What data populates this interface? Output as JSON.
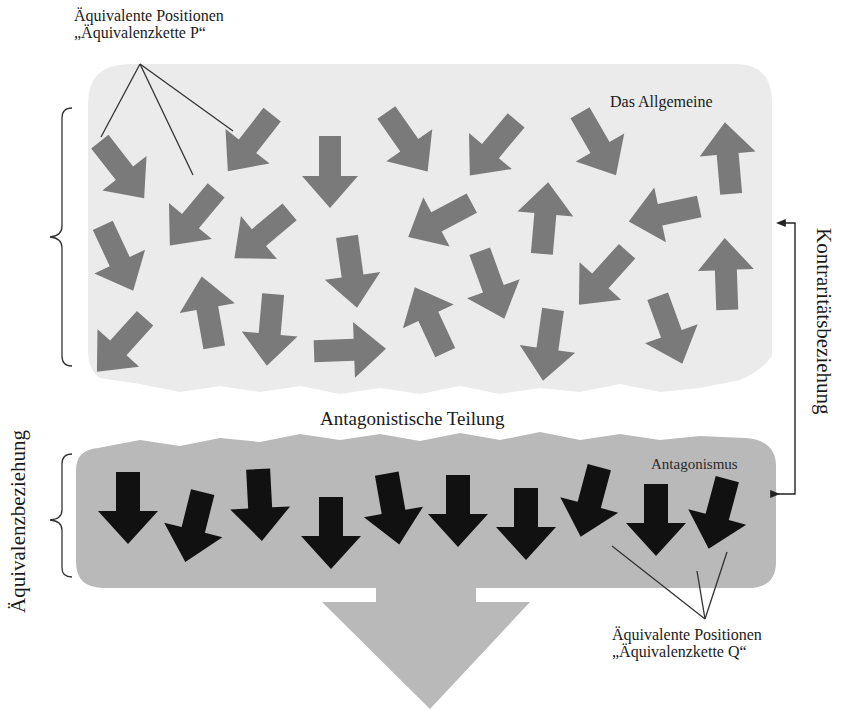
{
  "diagram": {
    "labels": {
      "equivalent_positions_top_line1": "Äquivalente Positionen",
      "equivalent_positions_top_line2": "„Äquivalenzkette P“",
      "general_region": "Das Allgemeine",
      "division": "Antagonistische Teilung",
      "antagonism_region": "Antagonismus",
      "equivalent_positions_bottom_line1": "Äquivalente Positionen",
      "equivalent_positions_bottom_line2": "„Äquivalenzkette Q“",
      "equivalence_relation": "Äquivalenzbeziehung",
      "contrariety_relation": "Kontraritätsbeziehung"
    },
    "colors": {
      "general_region_fill": "#ebebeb",
      "antagonism_region_fill": "#b9b9b9",
      "scattered_arrow_fill": "#7a7a7a",
      "aligned_arrow_fill": "#111111",
      "outcome_arrow_fill": "#b9b9b9",
      "line_color": "#333333"
    },
    "regions": [
      {
        "name": "Das Allgemeine",
        "description": "scattered gray arrows pointing in random directions",
        "arrow_count": 24
      },
      {
        "name": "Antagonismus",
        "description": "black arrows all pointing downward",
        "arrow_count": 10
      }
    ],
    "scattered_arrows": [
      {
        "x": 122,
        "y": 170,
        "rot": -38
      },
      {
        "x": 250,
        "y": 143,
        "rot": 38
      },
      {
        "x": 330,
        "y": 172,
        "rot": 0
      },
      {
        "x": 407,
        "y": 142,
        "rot": -35
      },
      {
        "x": 493,
        "y": 148,
        "rot": 40
      },
      {
        "x": 598,
        "y": 144,
        "rot": -30
      },
      {
        "x": 728,
        "y": 158,
        "rot": 175
      },
      {
        "x": 118,
        "y": 258,
        "rot": -25
      },
      {
        "x": 193,
        "y": 218,
        "rot": 40
      },
      {
        "x": 262,
        "y": 235,
        "rot": 50
      },
      {
        "x": 352,
        "y": 272,
        "rot": -8
      },
      {
        "x": 440,
        "y": 220,
        "rot": 62
      },
      {
        "x": 545,
        "y": 218,
        "rot": 185
      },
      {
        "x": 664,
        "y": 214,
        "rot": 78
      },
      {
        "x": 726,
        "y": 274,
        "rot": 178
      },
      {
        "x": 121,
        "y": 345,
        "rot": 42
      },
      {
        "x": 208,
        "y": 312,
        "rot": 170
      },
      {
        "x": 270,
        "y": 330,
        "rot": 5
      },
      {
        "x": 350,
        "y": 350,
        "rot": -92
      },
      {
        "x": 430,
        "y": 320,
        "rot": 155
      },
      {
        "x": 492,
        "y": 285,
        "rot": -20
      },
      {
        "x": 603,
        "y": 278,
        "rot": 42
      },
      {
        "x": 548,
        "y": 345,
        "rot": 8
      },
      {
        "x": 670,
        "y": 330,
        "rot": -20
      }
    ],
    "aligned_arrows": [
      {
        "x": 128,
        "y": 508,
        "rot": 0
      },
      {
        "x": 194,
        "y": 527,
        "rot": 14
      },
      {
        "x": 260,
        "y": 505,
        "rot": -3
      },
      {
        "x": 331,
        "y": 533,
        "rot": 0
      },
      {
        "x": 393,
        "y": 509,
        "rot": -10
      },
      {
        "x": 458,
        "y": 511,
        "rot": 0
      },
      {
        "x": 526,
        "y": 524,
        "rot": 0
      },
      {
        "x": 590,
        "y": 502,
        "rot": 15
      },
      {
        "x": 656,
        "y": 520,
        "rot": 0
      },
      {
        "x": 718,
        "y": 514,
        "rot": 15
      }
    ]
  }
}
